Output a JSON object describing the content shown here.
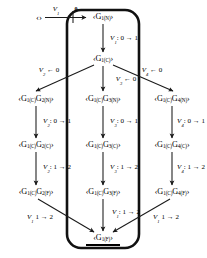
{
  "diagram": {
    "title_visible": false,
    "type": "state-transition-tree",
    "stroke_color": "#1a1a1a",
    "capsule": {
      "label": "rounded-capsule-outline",
      "x": 66,
      "y": 9,
      "w": 74,
      "h": 240,
      "radius": 14,
      "stroke_width": 2.6
    },
    "start": {
      "label": "‹›",
      "x": 39,
      "y": 17
    },
    "start_edge": {
      "var": "V",
      "sub": "1",
      "value": "0",
      "x": 56,
      "y": 11
    },
    "nodes": [
      {
        "id": "n1",
        "x": 103,
        "y": 17,
        "prefix": "‹G",
        "s1": "1(N)",
        "suffix": "›",
        "text": "‹G1(N)›"
      },
      {
        "id": "n2",
        "x": 103,
        "y": 59,
        "text": "‹G1(C)›"
      },
      {
        "id": "n3a",
        "x": 36,
        "y": 99,
        "text": "‹G1(C)G2(N)›"
      },
      {
        "id": "n3b",
        "x": 103,
        "y": 99,
        "text": "‹G1(C)G3(N)›"
      },
      {
        "id": "n3c",
        "x": 172,
        "y": 99,
        "text": "‹G1(C)G4(N)›"
      },
      {
        "id": "n4a",
        "x": 36,
        "y": 145,
        "text": "‹G1(C)G2(C)›"
      },
      {
        "id": "n4b",
        "x": 103,
        "y": 145,
        "text": "‹G1(C)G3(C)›"
      },
      {
        "id": "n4c",
        "x": 172,
        "y": 145,
        "text": "‹G1(C)G4(C)›"
      },
      {
        "id": "n5a",
        "x": 36,
        "y": 192,
        "text": "‹G1(C)G2(F)›"
      },
      {
        "id": "n5b",
        "x": 103,
        "y": 192,
        "text": "‹G1(C)G3(F)›"
      },
      {
        "id": "n5c",
        "x": 172,
        "y": 192,
        "text": "‹G1(C)G4(F)›"
      },
      {
        "id": "n6",
        "x": 103,
        "y": 238,
        "text": "‹G1(F)›"
      }
    ],
    "edge_labels": [
      {
        "id": "e-start",
        "var": "V",
        "sub": "1",
        "rest": "",
        "x": 56,
        "y": 11
      },
      {
        "id": "e-n1-n2",
        "var": "V",
        "sub": "1",
        "rest": ": 0 → 1",
        "x": 122,
        "y": 39
      },
      {
        "id": "e-b-left",
        "var": "V",
        "sub": "2",
        "rest": " ← 0",
        "x": 49,
        "y": 71
      },
      {
        "id": "e-b-mid",
        "var": "V",
        "sub": "3",
        "rest": " ← 0",
        "x": 124,
        "y": 80
      },
      {
        "id": "e-b-right",
        "var": "V",
        "sub": "4",
        "rest": " ← 0",
        "x": 152,
        "y": 71
      },
      {
        "id": "e-a-34",
        "var": "V",
        "sub": "2",
        "rest": ": 0 → 1",
        "x": 55,
        "y": 122
      },
      {
        "id": "e-b-34",
        "var": "V",
        "sub": "3",
        "rest": ": 0 → 1",
        "x": 122,
        "y": 122
      },
      {
        "id": "e-c-34",
        "var": "V",
        "sub": "4",
        "rest": ": 0 → 1",
        "x": 190,
        "y": 122
      },
      {
        "id": "e-a-45",
        "var": "V",
        "sub": "2",
        "rest": ": 1 → 2",
        "x": 55,
        "y": 168
      },
      {
        "id": "e-b-45",
        "var": "V",
        "sub": "3",
        "rest": ": 1 → 2",
        "x": 122,
        "y": 168
      },
      {
        "id": "e-c-45",
        "var": "V",
        "sub": "4",
        "rest": ": 1 → 2",
        "x": 190,
        "y": 168
      },
      {
        "id": "e-a-end",
        "var": "V",
        "sub": "1",
        "rest": " 1 → 2",
        "x": 40,
        "y": 218
      },
      {
        "id": "e-b-end",
        "var": "V",
        "sub": "1",
        "rest": ": 1 → 2",
        "x": 124,
        "y": 213
      },
      {
        "id": "e-c-end",
        "var": "V",
        "sub": "1",
        "rest": " 1 → 2",
        "x": 165,
        "y": 218
      }
    ],
    "zero_marker": {
      "text": "0",
      "x": 76,
      "y": 9
    }
  }
}
